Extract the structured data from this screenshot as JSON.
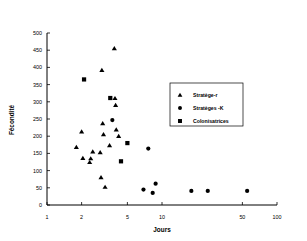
{
  "chart_data": {
    "type": "scatter",
    "title": "",
    "xlabel": "Jours",
    "ylabel": "Fécondité",
    "xscale": "log",
    "xlim": [
      1,
      100
    ],
    "ylim": [
      0,
      500
    ],
    "xticks": [
      1,
      2,
      5,
      10,
      50,
      100
    ],
    "xtick_labels": [
      "1",
      "2",
      "5",
      "10",
      "50",
      "100"
    ],
    "yticks": [
      0,
      50,
      100,
      150,
      200,
      250,
      300,
      350,
      400,
      450,
      500
    ],
    "ytick_labels": [
      "0",
      "50",
      "100",
      "150",
      "200",
      "250",
      "300",
      "350",
      "400",
      "450",
      "500"
    ],
    "grid": false,
    "legend_position": "right-middle",
    "series": [
      {
        "name": "Stratège-r",
        "marker": "triangle",
        "color": "#000000",
        "points": [
          [
            1.8,
            168
          ],
          [
            2.0,
            213
          ],
          [
            2.05,
            136
          ],
          [
            2.35,
            124
          ],
          [
            2.4,
            135
          ],
          [
            2.5,
            155
          ],
          [
            2.9,
            153
          ],
          [
            2.95,
            80
          ],
          [
            3.0,
            392
          ],
          [
            3.05,
            237
          ],
          [
            3.1,
            205
          ],
          [
            3.2,
            52
          ],
          [
            3.5,
            173
          ],
          [
            3.85,
            455
          ],
          [
            3.9,
            310
          ],
          [
            3.95,
            290
          ],
          [
            4.0,
            219
          ],
          [
            4.2,
            200
          ]
        ]
      },
      {
        "name": "Stratèges -K",
        "marker": "circle",
        "color": "#000000",
        "points": [
          [
            3.7,
            247
          ],
          [
            6.9,
            45
          ],
          [
            7.6,
            164
          ],
          [
            8.3,
            35
          ],
          [
            8.8,
            62
          ],
          [
            18.0,
            41
          ],
          [
            25.0,
            41
          ],
          [
            55.0,
            41
          ]
        ]
      },
      {
        "name": "Colonisatrices",
        "marker": "square",
        "color": "#000000",
        "points": [
          [
            2.1,
            365
          ],
          [
            3.55,
            311
          ],
          [
            4.4,
            127
          ],
          [
            5.0,
            180
          ]
        ]
      }
    ]
  },
  "legend": {
    "entries": [
      {
        "label": "Stratège-r",
        "marker": "triangle"
      },
      {
        "label": "Stratèges -K",
        "marker": "circle"
      },
      {
        "label": "Colonisatrices",
        "marker": "square"
      }
    ]
  }
}
